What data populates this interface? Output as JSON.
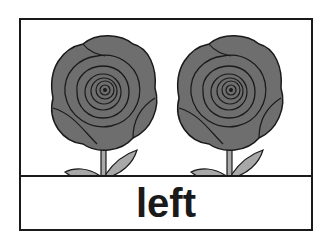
{
  "card": {
    "word": "left",
    "images": [
      {
        "name": "rose",
        "position": "left"
      },
      {
        "name": "rose",
        "position": "right"
      }
    ]
  },
  "colors": {
    "petal": "#6e6e6e",
    "outline": "#1a1a1a",
    "leaf": "#a8a8a8",
    "border": "#1a1a1a"
  }
}
